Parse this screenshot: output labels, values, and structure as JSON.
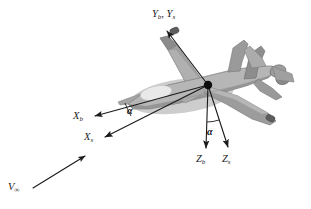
{
  "figure": {
    "type": "technical-diagram",
    "background_color": "#ffffff"
  },
  "labels": {
    "y_axes": {
      "base": "Y",
      "sub_b": "b",
      "sub_s": "s",
      "text": "Yb, Ys"
    },
    "x_body": {
      "base": "X",
      "sub": "b",
      "text": "Xb"
    },
    "x_stability": {
      "base": "X",
      "sub": "s",
      "text": "Xs"
    },
    "z_body": {
      "base": "Z",
      "sub": "b",
      "text": "Zb"
    },
    "z_stability": {
      "base": "Z",
      "sub": "s",
      "text": "Zs"
    },
    "velocity": {
      "base": "V",
      "sub": "∞",
      "text": "V∞"
    },
    "alpha_upper": "α",
    "alpha_lower": "α"
  },
  "colors": {
    "line": "#1a1a1a",
    "text": "#1a1a1a",
    "origin_dot": "#0d0d0d",
    "aircraft_light": "#c9c9c9",
    "aircraft_mid": "#a8a8a8",
    "aircraft_dark": "#8a8a8a",
    "aircraft_darker": "#6f6f6f",
    "aircraft_shadow": "#bcbcbc",
    "canopy": "#e4e4e4",
    "pod": "#5a5a5a"
  },
  "geometry": {
    "origin": {
      "x": 208,
      "y": 85
    },
    "vectors": [
      {
        "name": "Yb,Ys",
        "tip_x": 165,
        "tip_y": 29
      },
      {
        "name": "Xb",
        "tip_x": 92,
        "tip_y": 117
      },
      {
        "name": "Xs",
        "tip_x": 102,
        "tip_y": 138
      },
      {
        "name": "Zb",
        "tip_x": 206,
        "tip_y": 151
      },
      {
        "name": "Zs",
        "tip_x": 229,
        "tip_y": 150
      },
      {
        "name": "Vinf",
        "tip_x": 83,
        "tip_y": 154
      }
    ]
  }
}
